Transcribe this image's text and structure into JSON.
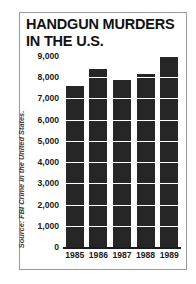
{
  "figure": {
    "title_line1": "HANDGUN MURDERS",
    "title_line2": "IN THE U.S.",
    "title": "HANDGUN MURDERS\nIN THE U.S.",
    "source": "Source: FBI Crime in the United States.",
    "bar_color": "#262626",
    "grid_color": "#ffffff",
    "axis_color": "#1b1b1b",
    "frame_color": "#9a9a9a"
  },
  "chart_data": {
    "type": "bar",
    "title": "HANDGUN MURDERS IN THE U.S.",
    "categories": [
      "1985",
      "1986",
      "1987",
      "1988",
      "1989"
    ],
    "values": [
      7600,
      8400,
      7850,
      8150,
      9000
    ],
    "series": [
      {
        "name": "Handgun murders",
        "values": [
          7600,
          8400,
          7850,
          8150,
          9000
        ]
      }
    ],
    "xlabel": "",
    "ylabel": "",
    "ylim": [
      0,
      9000
    ],
    "ytick_values": [
      0,
      1000,
      2000,
      3000,
      4000,
      5000,
      6000,
      7000,
      8000,
      9000
    ],
    "ytick_labels": [
      "0",
      "1,000",
      "2,000",
      "3,000",
      "4,000",
      "5,000",
      "6,000",
      "7,000",
      "8,000",
      "9,000"
    ],
    "grid": true,
    "grid_orientation": "horizontal",
    "legend": false,
    "annotations": [
      "Source: FBI Crime in the United States."
    ]
  }
}
